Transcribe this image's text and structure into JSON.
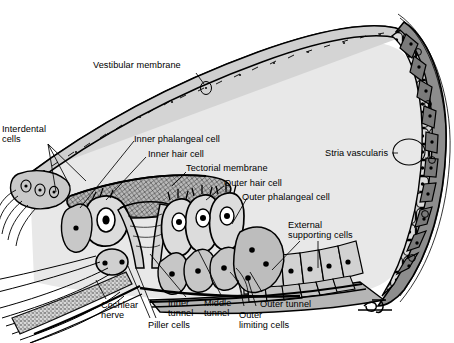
{
  "figure": {
    "signature": "BV",
    "colors": {
      "background": "#ffffff",
      "ink": "#000000",
      "scala_media_fill": "#e8e8e8",
      "epithelium_light": "#cfcfcf",
      "epithelium_mid": "#a8a8a8",
      "stria_dark": "#6e6e6e",
      "tectorial_fill": "#b9b9b9",
      "bone_stipple": "#8a8a8a"
    }
  },
  "labels": {
    "vestibular_membrane": "Vestibular membrane",
    "interdental_cells": "Interdental\ncells",
    "inner_phalangeal_cell": "Inner phalangeal cell",
    "inner_hair_cell": "Inner hair cell",
    "tectorial_membrane": "Tectorial membrane",
    "outer_hair_cell": "Outer hair cell",
    "outer_phalangeal_cell": "Outer phalangeal cell",
    "stria_vascularis": "Stria vascularis",
    "external_supporting_cells": "External\nsupporting cells",
    "cochlear_nerve": "Cochlear\nnerve",
    "piller_cells": "Piller cells",
    "inner_tunnel": "Inner\ntunnel",
    "middle_tunnel": "Middle\ntunnel",
    "outer_limiting_cells": "Outer\nlimiting cells",
    "outer_tunnel": "Outer tunnel"
  }
}
